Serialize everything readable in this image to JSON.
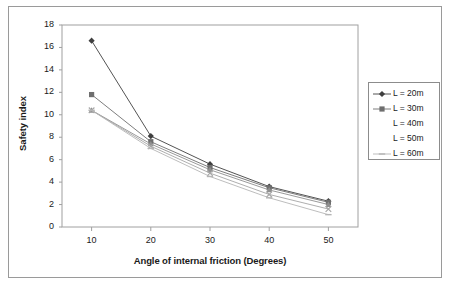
{
  "chart_data": {
    "type": "line",
    "title": "",
    "xlabel": "Angle of internal friction (Degrees)",
    "ylabel": "Safety index",
    "x": [
      10,
      20,
      30,
      40,
      50
    ],
    "xlim": [
      5,
      55
    ],
    "ylim": [
      0,
      18
    ],
    "xticks": [
      "10",
      "20",
      "30",
      "40",
      "50"
    ],
    "yticks": [
      "0",
      "2",
      "4",
      "6",
      "8",
      "10",
      "12",
      "14",
      "16",
      "18"
    ],
    "grid": false,
    "legend_position": "right",
    "series": [
      {
        "name": "L = 20m",
        "marker": "diamond",
        "color": "#3f3f3f",
        "values": [
          16.6,
          8.1,
          5.6,
          3.6,
          2.3
        ]
      },
      {
        "name": "L = 30m",
        "marker": "square",
        "color": "#6e6e6e",
        "values": [
          11.8,
          7.6,
          5.3,
          3.5,
          2.2
        ]
      },
      {
        "name": "L = 40m",
        "marker": "triangle",
        "color": "#8f8f8f",
        "values": [
          10.4,
          7.4,
          5.1,
          3.3,
          2.0
        ]
      },
      {
        "name": "L = 50m",
        "marker": "cross",
        "color": "#a5a5a5",
        "values": [
          10.4,
          7.2,
          4.8,
          2.9,
          1.6
        ]
      },
      {
        "name": "L = 60m",
        "marker": "dash",
        "color": "#b5b5b5",
        "values": [
          10.4,
          7.0,
          4.5,
          2.6,
          1.1
        ]
      }
    ]
  }
}
